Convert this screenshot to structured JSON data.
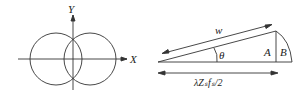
{
  "left_figure": {
    "axis_y_label": "Y",
    "axis_x_label": "X",
    "shape": "two overlapping circles centered on x-axis"
  },
  "right_figure": {
    "hypotenuse_label": "w",
    "angle_label": "θ",
    "segment_a_label": "A",
    "segment_b_label": "B",
    "base_label": "λZₛfₛ/2"
  },
  "colors": {
    "stroke": "#333333",
    "background": "#ffffff"
  }
}
